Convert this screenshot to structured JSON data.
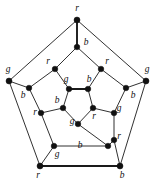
{
  "figure": {
    "width": 154,
    "height": 182,
    "background_color": "#ffffff",
    "stroke_color": "#1a1a1a",
    "label_color": "#111111",
    "vertex_color": "#111111",
    "color_key": {
      "r": "red",
      "g": "green",
      "b": "blue"
    }
  },
  "graph_data": {
    "type": "graph",
    "vertex_count": 20,
    "edge_count": 30,
    "label_set": [
      "r",
      "g",
      "b"
    ],
    "rings": [
      "outer",
      "middle-outer",
      "middle-inner",
      "inner"
    ],
    "vertices": [
      {
        "id": "o1",
        "label": "r",
        "ring": "outer",
        "x": 77,
        "y": 20,
        "lx": 77,
        "ly": 9,
        "r": 3.0
      },
      {
        "id": "o2",
        "label": "g",
        "ring": "outer",
        "x": 9,
        "y": 81,
        "lx": 8,
        "ly": 70,
        "r": 3.0
      },
      {
        "id": "o3",
        "label": "g",
        "ring": "outer",
        "x": 146,
        "y": 81,
        "lx": 147,
        "ly": 70,
        "r": 3.0
      },
      {
        "id": "o4",
        "label": "r",
        "ring": "outer",
        "x": 40,
        "y": 166,
        "lx": 38,
        "ly": 176,
        "r": 3.0
      },
      {
        "id": "o5",
        "label": "b",
        "ring": "outer",
        "x": 120,
        "y": 166,
        "lx": 122,
        "ly": 176,
        "r": 3.0
      },
      {
        "id": "m1",
        "label": "b",
        "ring": "middle-outer",
        "x": 77,
        "y": 47,
        "lx": 86,
        "ly": 43,
        "r": 2.8
      },
      {
        "id": "m2",
        "label": "b",
        "ring": "middle-outer",
        "x": 29,
        "y": 88,
        "lx": 23,
        "ly": 96,
        "r": 2.8
      },
      {
        "id": "m3",
        "label": "b",
        "ring": "middle-outer",
        "x": 126,
        "y": 88,
        "lx": 133,
        "ly": 96,
        "r": 2.8
      },
      {
        "id": "m4",
        "label": "g",
        "ring": "middle-outer",
        "x": 54,
        "y": 146,
        "lx": 57,
        "ly": 155,
        "r": 2.8
      },
      {
        "id": "m5",
        "label": "b",
        "ring": "middle-outer",
        "x": 108,
        "y": 146,
        "lx": 80,
        "ly": 146,
        "r": 2.8
      },
      {
        "id": "n1",
        "label": "r",
        "ring": "middle-inner",
        "x": 55,
        "y": 69,
        "lx": 48,
        "ly": 62,
        "r": 2.8
      },
      {
        "id": "n2",
        "label": "r",
        "ring": "middle-inner",
        "x": 101,
        "y": 69,
        "lx": 107,
        "ly": 62,
        "r": 2.8
      },
      {
        "id": "n3",
        "label": "r",
        "ring": "middle-inner",
        "x": 41,
        "y": 113,
        "lx": 35,
        "ly": 113,
        "r": 2.8
      },
      {
        "id": "n4",
        "label": "g",
        "ring": "middle-inner",
        "x": 114,
        "y": 113,
        "lx": 119,
        "ly": 109,
        "r": 2.8
      },
      {
        "id": "n5",
        "label": "r",
        "ring": "middle-inner",
        "x": 114,
        "y": 140,
        "lx": 119,
        "ly": 137,
        "r": 2.8
      },
      {
        "id": "i1",
        "label": "g",
        "ring": "inner",
        "x": 69,
        "y": 89,
        "lx": 66,
        "ly": 80,
        "r": 2.8
      },
      {
        "id": "i2",
        "label": "b",
        "ring": "inner",
        "x": 88,
        "y": 89,
        "lx": 89,
        "ly": 80,
        "r": 2.8
      },
      {
        "id": "i3",
        "label": "b",
        "ring": "inner",
        "x": 63,
        "y": 108,
        "lx": 57,
        "ly": 101,
        "r": 2.8
      },
      {
        "id": "i4",
        "label": "r",
        "ring": "inner",
        "x": 93,
        "y": 108,
        "lx": 94,
        "ly": 117,
        "r": 2.8
      },
      {
        "id": "i5",
        "label": "g",
        "ring": "inner",
        "x": 78,
        "y": 124,
        "lx": 72,
        "ly": 122,
        "r": 2.8
      }
    ],
    "edges": [
      {
        "from": "o1",
        "to": "o2",
        "bold": false
      },
      {
        "from": "o1",
        "to": "o3",
        "bold": false
      },
      {
        "from": "o2",
        "to": "o4",
        "bold": false
      },
      {
        "from": "o3",
        "to": "o5",
        "bold": false
      },
      {
        "from": "o4",
        "to": "o5",
        "bold": true
      },
      {
        "from": "o1",
        "to": "m1",
        "bold": true
      },
      {
        "from": "o2",
        "to": "m2",
        "bold": false
      },
      {
        "from": "o3",
        "to": "m3",
        "bold": false
      },
      {
        "from": "o4",
        "to": "m4",
        "bold": false
      },
      {
        "from": "o5",
        "to": "n5",
        "bold": false
      },
      {
        "from": "m1",
        "to": "n1",
        "bold": false
      },
      {
        "from": "m1",
        "to": "n2",
        "bold": false
      },
      {
        "from": "m2",
        "to": "n1",
        "bold": false
      },
      {
        "from": "m2",
        "to": "n3",
        "bold": false
      },
      {
        "from": "m3",
        "to": "n2",
        "bold": false
      },
      {
        "from": "m3",
        "to": "n4",
        "bold": false
      },
      {
        "from": "m4",
        "to": "n3",
        "bold": false
      },
      {
        "from": "m4",
        "to": "m5",
        "bold": false
      },
      {
        "from": "m5",
        "to": "n5",
        "bold": false
      },
      {
        "from": "n4",
        "to": "n5",
        "bold": false
      },
      {
        "from": "n1",
        "to": "i1",
        "bold": false
      },
      {
        "from": "n2",
        "to": "i2",
        "bold": false
      },
      {
        "from": "n3",
        "to": "i3",
        "bold": false
      },
      {
        "from": "n4",
        "to": "i4",
        "bold": false
      },
      {
        "from": "m5",
        "to": "i5",
        "bold": false
      },
      {
        "from": "i1",
        "to": "i2",
        "bold": true
      },
      {
        "from": "i1",
        "to": "i3",
        "bold": false
      },
      {
        "from": "i2",
        "to": "i4",
        "bold": false
      },
      {
        "from": "i3",
        "to": "i5",
        "bold": false
      },
      {
        "from": "i4",
        "to": "i5",
        "bold": false
      }
    ]
  }
}
